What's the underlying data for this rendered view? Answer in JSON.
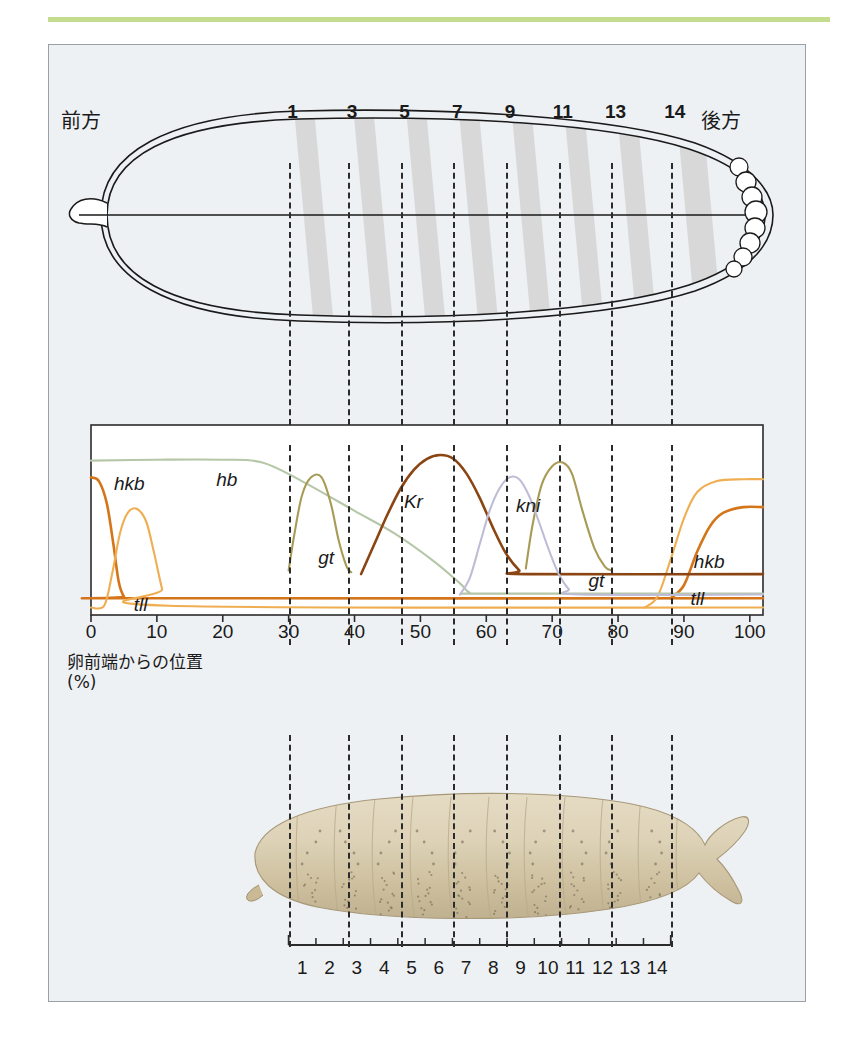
{
  "figure": {
    "accent_rule_color": "#c3dc8e",
    "frame_bg": "#eef1f4",
    "frame_border": "#9aa0a6"
  },
  "embryo_panel": {
    "anterior_label": "前方",
    "posterior_label": "後方",
    "parasegment_numbers": [
      "1",
      "3",
      "5",
      "7",
      "9",
      "11",
      "13",
      "14"
    ],
    "parasegment_x_percent": [
      30,
      39,
      47,
      55,
      63,
      71,
      79,
      88
    ],
    "stripe_fill": "#d4d4d4",
    "outline_color": "#1a1a1a",
    "pole_cells_label": "pole-cells"
  },
  "chart_data": {
    "type": "line",
    "title": "",
    "xlabel": "卵前端からの位置\n(%)",
    "xlabel_line1": "卵前端からの位置",
    "xlabel_line2": "(%)",
    "ylabel": "",
    "xlim": [
      0,
      102
    ],
    "ylim": [
      0,
      1
    ],
    "grid": false,
    "legend": "inline-annotations",
    "x_ticks": [
      0,
      10,
      20,
      30,
      40,
      50,
      60,
      70,
      80,
      90,
      100
    ],
    "x_tick_labels": [
      "0",
      "10",
      "20",
      "30",
      "40",
      "50",
      "60",
      "70",
      "80",
      "90",
      "100"
    ],
    "registration_lines_x": [
      30,
      39,
      47,
      55,
      63,
      71,
      79,
      88
    ],
    "series": [
      {
        "name": "hkb",
        "color": "#d4751a",
        "label_positions": [
          {
            "text": "hkb",
            "x": 3.5,
            "y": 0.7
          },
          {
            "text": "hkb",
            "x": 91.5,
            "y": 0.28
          }
        ],
        "domains": "anterior cap 0-6%, posterior cap 88-102%",
        "points_anterior": [
          [
            0,
            0.74
          ],
          [
            1.2,
            0.72
          ],
          [
            2.4,
            0.6
          ],
          [
            3.4,
            0.38
          ],
          [
            4.2,
            0.18
          ],
          [
            5.0,
            0.1
          ],
          [
            6.0,
            0.09
          ],
          [
            102,
            0.09
          ]
        ],
        "points_posterior": [
          [
            88,
            0.09
          ],
          [
            90,
            0.16
          ],
          [
            92,
            0.34
          ],
          [
            94,
            0.48
          ],
          [
            96,
            0.55
          ],
          [
            99,
            0.58
          ],
          [
            102,
            0.58
          ]
        ]
      },
      {
        "name": "tll",
        "color": "#f0ae52",
        "label_positions": [
          {
            "text": "tll",
            "x": 6.5,
            "y": 0.05
          },
          {
            "text": "tll",
            "x": 91.0,
            "y": 0.08
          }
        ],
        "domains": "anterior 2-12%, posterior 85-102%",
        "points_anterior": [
          [
            0,
            0.04
          ],
          [
            2.0,
            0.05
          ],
          [
            3.2,
            0.22
          ],
          [
            4.4,
            0.44
          ],
          [
            5.6,
            0.55
          ],
          [
            7.0,
            0.57
          ],
          [
            8.4,
            0.5
          ],
          [
            9.6,
            0.33
          ],
          [
            10.8,
            0.14
          ],
          [
            11.8,
            0.05
          ],
          [
            102,
            0.04
          ]
        ],
        "points_posterior": [
          [
            84,
            0.04
          ],
          [
            86,
            0.1
          ],
          [
            88,
            0.3
          ],
          [
            90,
            0.52
          ],
          [
            92,
            0.66
          ],
          [
            95,
            0.72
          ],
          [
            99,
            0.73
          ],
          [
            102,
            0.73
          ]
        ]
      },
      {
        "name": "hb",
        "color": "#b6c7a8",
        "label_positions": [
          {
            "text": "hb",
            "x": 19.0,
            "y": 0.72
          }
        ],
        "domains": "anterior broad 0-57%",
        "points": [
          [
            0,
            0.83
          ],
          [
            10,
            0.835
          ],
          [
            20,
            0.835
          ],
          [
            26,
            0.82
          ],
          [
            32,
            0.72
          ],
          [
            40,
            0.56
          ],
          [
            46,
            0.44
          ],
          [
            52,
            0.29
          ],
          [
            56,
            0.17
          ],
          [
            57.5,
            0.12
          ],
          [
            60,
            0.115
          ],
          [
            102,
            0.115
          ]
        ]
      },
      {
        "name": "gt",
        "color": "#a79b55",
        "label_positions": [
          {
            "text": "gt",
            "x": 34.5,
            "y": 0.3
          },
          {
            "text": "gt",
            "x": 75.5,
            "y": 0.18
          }
        ],
        "domains": "anterior stripe 30-39%, posterior stripe 66-79%",
        "points_anterior": [
          [
            30,
            0.24
          ],
          [
            30.8,
            0.42
          ],
          [
            32,
            0.64
          ],
          [
            33.4,
            0.74
          ],
          [
            35,
            0.74
          ],
          [
            36.4,
            0.6
          ],
          [
            37.6,
            0.4
          ],
          [
            38.8,
            0.26
          ],
          [
            39.5,
            0.23
          ]
        ],
        "points_posterior": [
          [
            66,
            0.25
          ],
          [
            67,
            0.48
          ],
          [
            68.4,
            0.7
          ],
          [
            70,
            0.8
          ],
          [
            71.6,
            0.82
          ],
          [
            73,
            0.76
          ],
          [
            74.6,
            0.56
          ],
          [
            76.4,
            0.36
          ],
          [
            78,
            0.26
          ],
          [
            79,
            0.24
          ]
        ]
      },
      {
        "name": "Kr",
        "color": "#8b4513",
        "label_positions": [
          {
            "text": "Kr",
            "x": 47.5,
            "y": 0.6
          }
        ],
        "domains": "central 41-66%",
        "points": [
          [
            41,
            0.22
          ],
          [
            43,
            0.38
          ],
          [
            45,
            0.54
          ],
          [
            47,
            0.68
          ],
          [
            49,
            0.78
          ],
          [
            51,
            0.84
          ],
          [
            53,
            0.86
          ],
          [
            55,
            0.84
          ],
          [
            57,
            0.76
          ],
          [
            59,
            0.63
          ],
          [
            61,
            0.47
          ],
          [
            63,
            0.33
          ],
          [
            65,
            0.24
          ],
          [
            66,
            0.22
          ],
          [
            102,
            0.22
          ]
        ]
      },
      {
        "name": "kni",
        "color": "#bfbdd6",
        "label_positions": [
          {
            "text": "kni",
            "x": 64.5,
            "y": 0.58
          }
        ],
        "domains": "posterior-central 56-74%",
        "points": [
          [
            56,
            0.11
          ],
          [
            57.5,
            0.2
          ],
          [
            59,
            0.38
          ],
          [
            60.5,
            0.56
          ],
          [
            62,
            0.68
          ],
          [
            63.5,
            0.74
          ],
          [
            65,
            0.73
          ],
          [
            66.5,
            0.64
          ],
          [
            68,
            0.5
          ],
          [
            69.5,
            0.35
          ],
          [
            71,
            0.22
          ],
          [
            72.5,
            0.14
          ],
          [
            74,
            0.11
          ],
          [
            102,
            0.11
          ]
        ]
      }
    ]
  },
  "larva_panel": {
    "segment_numbers": [
      "1",
      "2",
      "3",
      "4",
      "5",
      "6",
      "7",
      "8",
      "9",
      "10",
      "11",
      "12",
      "13",
      "14"
    ],
    "ruler_start_percent": 30,
    "ruler_end_percent": 88,
    "image_description": "drosophila-larva-photograph"
  }
}
